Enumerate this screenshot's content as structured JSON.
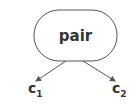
{
  "diagram": {
    "root": {
      "label": "pair",
      "shape": "rounded-rectangle",
      "stroke": "#555555"
    },
    "children": [
      {
        "base": "c",
        "subscript": "1"
      },
      {
        "base": "c",
        "subscript": "2"
      }
    ],
    "edge_color": "#555555"
  }
}
